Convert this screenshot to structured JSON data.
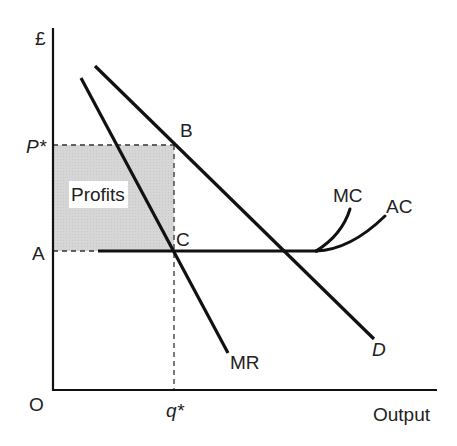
{
  "diagram": {
    "type": "monopoly-profit-maximisation",
    "axes": {
      "y_label": "£",
      "x_label": "Output",
      "origin_label": "O"
    },
    "price_label": "P*",
    "quantity_label": "q*",
    "cost_level_label": "A",
    "points": {
      "b": "B",
      "c": "C"
    },
    "curves": {
      "demand": "D",
      "marginal_revenue": "MR",
      "marginal_cost": "MC",
      "average_cost": "AC"
    },
    "shaded_region_label": "Profits",
    "colors": {
      "line": "#111111",
      "shade": "#d4d4d4",
      "background": "#ffffff"
    }
  }
}
